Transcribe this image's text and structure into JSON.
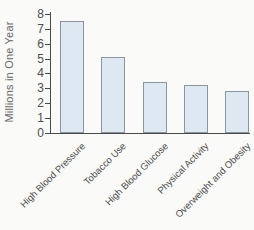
{
  "figure": {
    "background_color": "#fafaf8"
  },
  "chart_data": {
    "type": "bar",
    "categories": [
      "High Blood Pressure",
      "Tobacco Use",
      "High Blood Glucose",
      "Physical Activity",
      "Overweight and Obesity"
    ],
    "values": [
      7.5,
      5.1,
      3.4,
      3.2,
      2.8
    ],
    "title": "",
    "xlabel": "",
    "ylabel": "Millions in One Year",
    "ylim": [
      0,
      8
    ],
    "ytick_step": 1,
    "yticks": [
      0,
      1,
      2,
      3,
      4,
      5,
      6,
      7,
      8
    ],
    "grid": false,
    "legend": false,
    "bar_fill": "#dde8f2",
    "bar_border": "#8b95a0",
    "axis_color": "#4a4a4a",
    "tick_text_color": "#4d4d4d",
    "category_text_color": "#4d4d4d",
    "ylabel_text_color": "#666666",
    "category_label_rotation_deg": -45
  }
}
